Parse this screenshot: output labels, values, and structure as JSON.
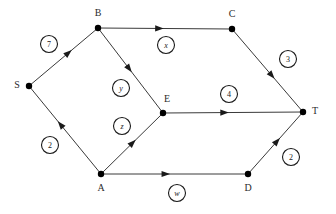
{
  "figure": {
    "kind": "directed-weighted-graph",
    "background_color": "#ffffff",
    "edge_color": "#3a3a3a",
    "node_color": "#000000",
    "label_color": "#2b2b2b",
    "width": 336,
    "height": 214
  },
  "nodes": [
    {
      "id": "S",
      "label": "S",
      "x": 29,
      "y": 86,
      "label_x": 17,
      "label_y": 86
    },
    {
      "id": "B",
      "label": "B",
      "x": 98,
      "y": 28,
      "label_x": 98,
      "label_y": 14
    },
    {
      "id": "C",
      "label": "C",
      "x": 232,
      "y": 29,
      "label_x": 232,
      "label_y": 15
    },
    {
      "id": "E",
      "label": "E",
      "x": 163,
      "y": 113,
      "label_x": 167,
      "label_y": 100
    },
    {
      "id": "T",
      "label": "T",
      "x": 303,
      "y": 112,
      "label_x": 315,
      "label_y": 112
    },
    {
      "id": "A",
      "label": "A",
      "x": 101,
      "y": 174,
      "label_x": 101,
      "label_y": 189
    },
    {
      "id": "D",
      "label": "D",
      "x": 248,
      "y": 174,
      "label_x": 248,
      "label_y": 189
    }
  ],
  "edges": [
    {
      "id": "S-B",
      "from": "S",
      "to": "B",
      "direction": "S->B",
      "weight": "7",
      "weight_kind": "number",
      "weight_x": 49,
      "weight_y": 44,
      "arrow_t": 0.62
    },
    {
      "id": "B-C",
      "from": "B",
      "to": "C",
      "direction": "B->C",
      "weight": "x",
      "weight_kind": "variable",
      "weight_x": 166,
      "weight_y": 45,
      "arrow_t": 0.49
    },
    {
      "id": "C-T",
      "from": "C",
      "to": "T",
      "direction": "C->T",
      "weight": "3",
      "weight_kind": "number",
      "weight_x": 288,
      "weight_y": 59,
      "arrow_t": 0.6
    },
    {
      "id": "B-E",
      "from": "B",
      "to": "E",
      "direction": "B->E",
      "weight": "y",
      "weight_kind": "variable",
      "weight_x": 121,
      "weight_y": 88,
      "arrow_t": 0.52
    },
    {
      "id": "E-T",
      "from": "E",
      "to": "T",
      "direction": "E->T",
      "weight": "4",
      "weight_kind": "number",
      "weight_x": 229,
      "weight_y": 94,
      "arrow_t": 0.47
    },
    {
      "id": "A-S",
      "from": "A",
      "to": "S",
      "direction": "A->S",
      "weight": "2",
      "weight_kind": "number",
      "weight_x": 50,
      "weight_y": 145,
      "arrow_t": 0.6
    },
    {
      "id": "A-E",
      "from": "A",
      "to": "E",
      "direction": "A->E",
      "weight": "z",
      "weight_kind": "variable",
      "weight_x": 122,
      "weight_y": 126,
      "arrow_t": 0.56
    },
    {
      "id": "A-D",
      "from": "A",
      "to": "D",
      "direction": "A->D",
      "weight": "w",
      "weight_kind": "variable",
      "weight_x": 177,
      "weight_y": 193,
      "arrow_t": 0.47
    },
    {
      "id": "D-T",
      "from": "D",
      "to": "T",
      "direction": "D->T",
      "weight": "2",
      "weight_kind": "number",
      "weight_x": 291,
      "weight_y": 157,
      "arrow_t": 0.58
    }
  ],
  "weight_circle_radius": 8.5,
  "node_dot_radius": 3.2
}
